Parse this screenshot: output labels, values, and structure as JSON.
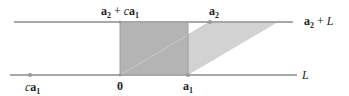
{
  "diagram": {
    "labels": {
      "a2_plus_ca1_a": "a",
      "a2_plus_ca1_sub1": "2",
      "a2_plus_ca1_op": " + ",
      "a2_plus_ca1_c": "c",
      "a2_plus_ca1_b": "a",
      "a2_plus_ca1_sub2": "1",
      "a2_a": "a",
      "a2_sub": "2",
      "a2L_a": "a",
      "a2L_sub": "2",
      "a2L_rest": " + ",
      "a2L_L": "L",
      "L": "L",
      "ca1_c": "c",
      "ca1_a": "a",
      "ca1_sub": "1",
      "zero": "0",
      "a1_a": "a",
      "a1_sub": "1"
    },
    "colors": {
      "line": "#a8a8a8",
      "dark_fill": "#b4b4b4",
      "light_fill": "#d2d2d2"
    }
  }
}
